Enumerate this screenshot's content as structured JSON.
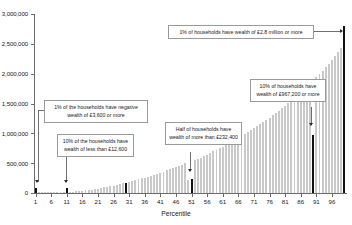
{
  "chart_data": {
    "type": "bar",
    "title": "",
    "xlabel": "Percentile",
    "ylabel": "",
    "ylim": [
      0,
      3000000
    ],
    "xlim": [
      1,
      100
    ],
    "grid": false,
    "legend": "none",
    "y_ticks": [
      "0",
      "500,000",
      "1,000,000",
      "1,500,000",
      "2,000,000",
      "2,500,000",
      "3,000,000"
    ],
    "y_tick_values": [
      0,
      500000,
      1000000,
      1500000,
      2000000,
      2500000,
      3000000
    ],
    "x_ticks": [
      "1",
      "6",
      "11",
      "16",
      "21",
      "26",
      "31",
      "36",
      "41",
      "46",
      "51",
      "56",
      "61",
      "66",
      "71",
      "76",
      "81",
      "86",
      "91",
      "96"
    ],
    "x_tick_values": [
      1,
      6,
      11,
      16,
      21,
      26,
      31,
      36,
      41,
      46,
      51,
      56,
      61,
      66,
      71,
      76,
      81,
      86,
      91,
      96
    ],
    "bar_color": "#c9c9c9",
    "highlight_color": "#111111",
    "highlighted_percentiles": [
      1,
      11,
      30,
      51,
      90,
      100
    ],
    "categories": [
      1,
      2,
      3,
      4,
      5,
      6,
      7,
      8,
      9,
      10,
      11,
      12,
      13,
      14,
      15,
      16,
      17,
      18,
      19,
      20,
      21,
      22,
      23,
      24,
      25,
      26,
      27,
      28,
      29,
      30,
      31,
      32,
      33,
      34,
      35,
      36,
      37,
      38,
      39,
      40,
      41,
      42,
      43,
      44,
      45,
      46,
      47,
      48,
      49,
      50,
      51,
      52,
      53,
      54,
      55,
      56,
      57,
      58,
      59,
      60,
      61,
      62,
      63,
      64,
      65,
      66,
      67,
      68,
      69,
      70,
      71,
      72,
      73,
      74,
      75,
      76,
      77,
      78,
      79,
      80,
      81,
      82,
      83,
      84,
      85,
      86,
      87,
      88,
      89,
      90,
      91,
      92,
      93,
      94,
      95,
      96,
      97,
      98,
      99,
      100
    ],
    "values": [
      -3600,
      -1200,
      0,
      300,
      800,
      1500,
      2600,
      4200,
      6800,
      9500,
      12600,
      16500,
      21000,
      26000,
      31500,
      37500,
      44000,
      51000,
      58500,
      66500,
      75000,
      84000,
      93500,
      103500,
      114000,
      125000,
      136500,
      148500,
      161000,
      174000,
      187500,
      201000,
      215000,
      229000,
      243500,
      258500,
      274000,
      290000,
      306500,
      323500,
      341000,
      359000,
      377500,
      396500,
      416000,
      436000,
      456500,
      477500,
      499000,
      221000,
      232400,
      545000,
      569000,
      593500,
      618500,
      644000,
      670000,
      696500,
      723500,
      751000,
      779000,
      807500,
      836500,
      866000,
      896000,
      926500,
      957500,
      989000,
      1021000,
      1053500,
      1086500,
      1120000,
      1154000,
      1189000,
      1225000,
      1262000,
      1300000,
      1339000,
      1379000,
      1420000,
      1462000,
      1505000,
      1549000,
      1594000,
      1640000,
      1687000,
      1735000,
      1784000,
      1834000,
      967200,
      1938000,
      1992000,
      2048000,
      2106000,
      2166000,
      2228000,
      2292000,
      2358000,
      2426000,
      2800000
    ]
  },
  "annotations": [
    {
      "id": "top-1pct",
      "text": "1% of households have wealth of £2.8 million or more",
      "value": 2800000,
      "percentile": 100
    },
    {
      "id": "neg-1pct",
      "text": "1% of the households have negative wealth of £3,600 or more",
      "value": -3600,
      "percentile": 1
    },
    {
      "id": "bottom-10pct",
      "text": "10% of the households have wealth of less than £12,600",
      "value": 12600,
      "percentile": 11
    },
    {
      "id": "median",
      "text": "Half of households have wealth of more than £232,400",
      "value": 232400,
      "percentile": 51
    },
    {
      "id": "top-10pct",
      "text": "10% of households have wealth of £967,200 or more",
      "value": 967200,
      "percentile": 90
    }
  ]
}
